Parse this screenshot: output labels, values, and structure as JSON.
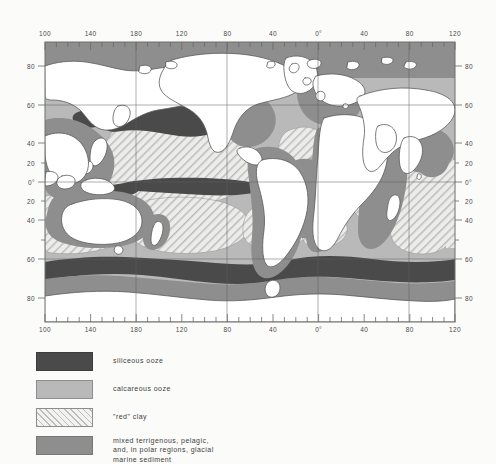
{
  "figure": {
    "kind": "world-map",
    "projection": "rectangular lat-lon",
    "frame_px": {
      "left": 45,
      "top": 42,
      "right": 455,
      "bottom": 322
    }
  },
  "axes": {
    "top_label_values": [
      "100",
      "140",
      "180",
      "120",
      "80",
      "40",
      "0°",
      "40",
      "80",
      "120"
    ],
    "bottom_label_values": [
      "100",
      "140",
      "180",
      "120",
      "80",
      "40",
      "0°",
      "40",
      "80",
      "120"
    ],
    "left_label_values": [
      "80",
      "60",
      "40",
      "20",
      "0°",
      "20",
      "40",
      "60",
      "80"
    ],
    "right_label_values": [
      "80",
      "60",
      "40",
      "20",
      "0°",
      "20",
      "40",
      "60",
      "80"
    ],
    "lon_range": [
      100,
      480
    ],
    "lat_range": [
      -90,
      90
    ],
    "minor_tick_interval_deg": 10,
    "major_tick_interval_deg": 40,
    "gridline_lat": [
      60,
      0,
      -60
    ],
    "gridline_lon": [
      180,
      260,
      360,
      440
    ]
  },
  "legend": {
    "items": [
      {
        "key": "siliceous",
        "label": "siliceous ooze",
        "swatch": "solid-dark",
        "color": "#4a4a4a"
      },
      {
        "key": "calcareous",
        "label": "calcareous ooze",
        "swatch": "solid-light",
        "color": "#b9b9b9"
      },
      {
        "key": "red-clay",
        "label": "\"red\" clay",
        "swatch": "diagonal-hatch",
        "color": "#bdbdbd"
      },
      {
        "key": "mixed",
        "label": "mixed terrigenous, pelagic,\nand, in polar regions, glacial\nmarine sediment",
        "swatch": "solid-medium",
        "color": "#8e8e8e"
      }
    ]
  },
  "colors": {
    "background": "#fbfbfa",
    "land": "#ffffff",
    "land_outline": "#5d5d5d",
    "siliceous_ooze": "#4a4a4a",
    "calcareous_ooze": "#b9b9b9",
    "red_clay_hatch": "#bdbdbd",
    "red_clay_base": "#ececea",
    "mixed_sediment": "#8e8e8e",
    "frame_line": "#7a7a7a",
    "grid_line": "#6f6f6f",
    "tick": "#6a6a6a",
    "text": "#3d3d3d"
  },
  "map_regions": [
    {
      "name": "arctic-ocean-mixed",
      "type": "mixed"
    },
    {
      "name": "north-pacific-siliceous-belt",
      "type": "siliceous"
    },
    {
      "name": "north-pacific-red-clay",
      "type": "red-clay"
    },
    {
      "name": "equatorial-pacific-siliceous",
      "type": "siliceous"
    },
    {
      "name": "south-pacific-calcareous",
      "type": "calcareous"
    },
    {
      "name": "south-pacific-red-clay",
      "type": "red-clay"
    },
    {
      "name": "atlantic-calcareous-ridge",
      "type": "calcareous"
    },
    {
      "name": "north-atlantic-red-clay",
      "type": "red-clay"
    },
    {
      "name": "indian-ocean-calcareous",
      "type": "calcareous"
    },
    {
      "name": "indian-ocean-red-clay",
      "type": "red-clay"
    },
    {
      "name": "antarctic-siliceous-belt",
      "type": "siliceous"
    },
    {
      "name": "antarctic-glacial-marine",
      "type": "mixed"
    },
    {
      "name": "continental-margin-terrigenous",
      "type": "mixed"
    }
  ]
}
